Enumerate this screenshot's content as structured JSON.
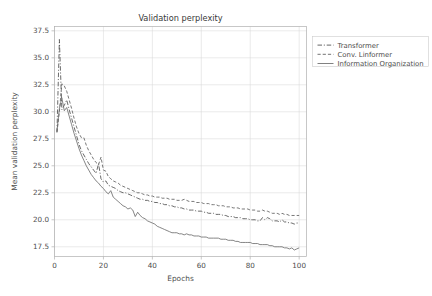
{
  "chart_data": {
    "type": "line",
    "title": "Validation perplexity",
    "xlabel": "Epochs",
    "ylabel": "Mean validation perplexity",
    "xlim": [
      0,
      103
    ],
    "ylim": [
      16.6,
      37.9
    ],
    "xticks": [
      0,
      20,
      40,
      60,
      80,
      100
    ],
    "yticks": [
      17.5,
      20.0,
      22.5,
      25.0,
      27.5,
      30.0,
      32.5,
      35.0,
      37.5
    ],
    "xtick_labels": [
      "0",
      "20",
      "40",
      "60",
      "80",
      "100"
    ],
    "ytick_labels": [
      "17.5",
      "20.0",
      "22.5",
      "25.0",
      "27.5",
      "30.0",
      "32.5",
      "35.0",
      "37.5"
    ],
    "grid": true,
    "legend_position": "upper right outside",
    "x": [
      1,
      2,
      3,
      4,
      5,
      6,
      7,
      8,
      9,
      10,
      11,
      12,
      13,
      14,
      15,
      16,
      17,
      18,
      19,
      20,
      21,
      22,
      23,
      24,
      25,
      26,
      27,
      28,
      29,
      30,
      31,
      32,
      33,
      34,
      35,
      36,
      37,
      38,
      39,
      40,
      41,
      42,
      43,
      44,
      45,
      46,
      47,
      48,
      49,
      50,
      51,
      52,
      53,
      54,
      55,
      56,
      57,
      58,
      59,
      60,
      61,
      62,
      63,
      64,
      65,
      66,
      67,
      68,
      69,
      70,
      71,
      72,
      73,
      74,
      75,
      76,
      77,
      78,
      79,
      80,
      81,
      82,
      83,
      84,
      85,
      86,
      87,
      88,
      89,
      90,
      91,
      92,
      93,
      94,
      95,
      96,
      97,
      98,
      99,
      100
    ],
    "series": [
      {
        "name": "Transformer",
        "linestyle": "dashdot",
        "color": "#4a4a4a",
        "values": [
          28.1,
          36.7,
          30.2,
          30.6,
          31.1,
          30.2,
          29.4,
          28.6,
          27.8,
          27.0,
          26.4,
          26.0,
          25.6,
          25.2,
          24.9,
          24.6,
          24.3,
          25.2,
          23.8,
          23.5,
          23.6,
          23.2,
          23.1,
          23.0,
          22.9,
          22.7,
          22.6,
          22.5,
          22.5,
          22.4,
          22.3,
          22.2,
          22.1,
          22.0,
          21.9,
          21.9,
          21.8,
          21.8,
          21.7,
          21.7,
          21.6,
          21.6,
          21.5,
          21.5,
          21.4,
          21.4,
          21.3,
          21.3,
          21.2,
          21.2,
          21.1,
          21.1,
          21.0,
          21.0,
          20.9,
          20.9,
          20.9,
          20.8,
          20.8,
          20.8,
          20.7,
          20.7,
          20.6,
          20.6,
          20.6,
          20.5,
          20.5,
          20.5,
          20.4,
          20.4,
          20.3,
          20.3,
          20.3,
          20.2,
          20.2,
          20.2,
          20.1,
          20.1,
          20.1,
          20.0,
          20.0,
          20.0,
          19.9,
          19.9,
          20.2,
          20.0,
          20.2,
          20.1,
          19.9,
          19.9,
          19.9,
          19.8,
          20.0,
          19.8,
          19.8,
          19.7,
          19.7,
          19.6,
          19.7,
          19.7
        ]
      },
      {
        "name": "Conv. Linformer",
        "linestyle": "dashed",
        "color": "#5a5a5a",
        "values": [
          28.1,
          30.0,
          32.6,
          32.4,
          31.9,
          31.1,
          30.3,
          29.4,
          28.6,
          28.0,
          27.6,
          27.6,
          26.9,
          26.4,
          26.0,
          25.6,
          25.3,
          25.1,
          25.8,
          24.6,
          24.5,
          24.0,
          23.8,
          23.6,
          23.5,
          23.4,
          23.2,
          23.1,
          23.0,
          22.9,
          22.8,
          22.7,
          22.6,
          22.5,
          22.5,
          22.4,
          22.3,
          22.3,
          22.2,
          22.2,
          22.1,
          22.1,
          22.1,
          22.0,
          22.0,
          22.0,
          21.9,
          21.9,
          21.9,
          21.8,
          21.8,
          21.8,
          21.9,
          21.8,
          21.7,
          21.7,
          21.7,
          21.6,
          21.6,
          21.6,
          21.5,
          21.5,
          21.5,
          21.4,
          21.4,
          21.4,
          21.3,
          21.3,
          21.3,
          21.2,
          21.2,
          21.2,
          21.1,
          21.1,
          21.1,
          21.0,
          21.0,
          21.0,
          21.0,
          20.9,
          20.9,
          20.9,
          20.8,
          20.8,
          20.9,
          20.8,
          20.8,
          20.7,
          20.6,
          20.6,
          20.6,
          20.5,
          20.6,
          20.5,
          20.5,
          20.4,
          20.4,
          20.4,
          20.4,
          20.4
        ]
      },
      {
        "name": "Information Organization",
        "linestyle": "solid",
        "color": "#6a6a6a",
        "values": [
          28.2,
          30.3,
          31.3,
          30.1,
          30.4,
          29.6,
          28.8,
          28.0,
          27.3,
          26.6,
          26.0,
          25.5,
          25.0,
          24.6,
          24.2,
          23.9,
          23.6,
          23.4,
          23.1,
          22.9,
          22.6,
          22.4,
          22.7,
          22.1,
          21.9,
          21.7,
          21.5,
          21.3,
          21.2,
          21.0,
          21.1,
          20.9,
          20.3,
          20.7,
          20.4,
          20.2,
          20.1,
          19.9,
          19.8,
          19.7,
          19.6,
          19.4,
          19.3,
          19.2,
          19.1,
          19.0,
          18.9,
          18.8,
          18.8,
          18.8,
          18.7,
          18.7,
          18.6,
          18.7,
          18.6,
          18.6,
          18.5,
          18.5,
          18.5,
          18.4,
          18.4,
          18.4,
          18.3,
          18.3,
          18.3,
          18.3,
          18.3,
          18.2,
          18.2,
          18.2,
          18.1,
          18.1,
          18.1,
          18.0,
          18.0,
          17.9,
          17.9,
          17.9,
          17.9,
          17.9,
          17.8,
          17.8,
          17.8,
          17.7,
          17.7,
          17.7,
          17.7,
          17.6,
          17.6,
          17.5,
          17.5,
          17.5,
          17.5,
          17.4,
          17.4,
          17.3,
          17.4,
          17.2,
          17.3,
          17.4
        ]
      }
    ]
  },
  "legend": {
    "entries": [
      {
        "label": "Transformer"
      },
      {
        "label": "Conv. Linformer"
      },
      {
        "label": "Information Organization"
      }
    ]
  }
}
